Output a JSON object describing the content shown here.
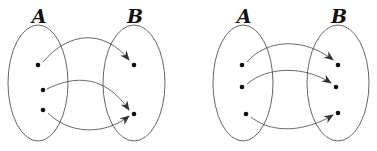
{
  "diagrams": [
    {
      "name": "left-mapping",
      "domain_label": "A",
      "codomain_label": "B",
      "domain_points": 3,
      "codomain_points": 2,
      "mappings": [
        [
          0,
          0
        ],
        [
          1,
          1
        ],
        [
          2,
          1
        ]
      ]
    },
    {
      "name": "right-mapping",
      "domain_label": "A",
      "codomain_label": "B",
      "domain_points": 3,
      "codomain_points": 3,
      "mappings": [
        [
          0,
          0
        ],
        [
          1,
          1
        ],
        [
          2,
          2
        ]
      ]
    }
  ]
}
